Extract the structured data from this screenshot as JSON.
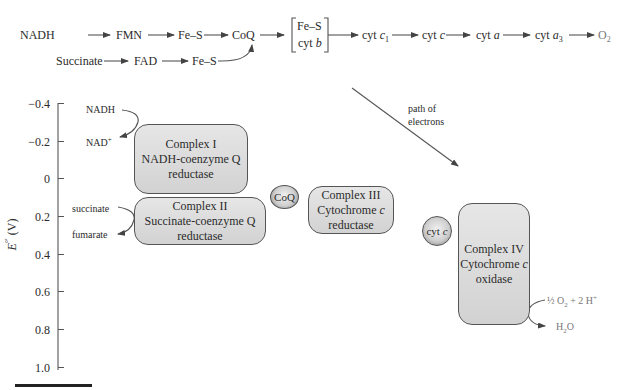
{
  "top_chain": {
    "row1": [
      {
        "label": "NADH"
      },
      {
        "label": "FMN"
      },
      {
        "label": "Fe–S"
      },
      {
        "label": "CoQ"
      },
      {
        "label_line1": "Fe–S",
        "label_line2_prefix": "cyt ",
        "label_line2_italic": "b"
      },
      {
        "label_prefix": "cyt ",
        "label_italic": "c",
        "label_sub": "1"
      },
      {
        "label_prefix": "cyt ",
        "label_italic": "c"
      },
      {
        "label_prefix": "cyt ",
        "label_italic": "a"
      },
      {
        "label_prefix": "cyt ",
        "label_italic": "a",
        "label_sub": "3"
      },
      {
        "label": "O",
        "label_sub": "2"
      }
    ],
    "row2": [
      {
        "label": "Succinate"
      },
      {
        "label": "FAD"
      },
      {
        "label": "Fe–S"
      }
    ]
  },
  "axis": {
    "label_main": "E",
    "label_sup": "°′",
    "label_unit": " (V)",
    "ticks": [
      "−0.4",
      "−0.2",
      "0",
      "0.2",
      "0.4",
      "0.6",
      "0.8",
      "1.0"
    ]
  },
  "annotations": {
    "nadh": "NADH",
    "nad_plus": "NAD",
    "nad_plus_sup": "+",
    "succinate": "succinate",
    "fumarate": "fumarate",
    "path_line1": "path of",
    "path_line2": "electrons",
    "o2_half": "½",
    "o2_rest": " O",
    "o2_sub": "2",
    "o2_tail": " + 2 H",
    "o2_sup": "+",
    "h2o_h": "H",
    "h2o_sub": "2",
    "h2o_o": "O"
  },
  "complexes": [
    {
      "line1": "Complex I",
      "line2": "NADH-coenzyme Q",
      "line3": "reductase"
    },
    {
      "line1": "Complex II",
      "line2": "Succinate-coenzyme Q",
      "line3": "reductase"
    },
    {
      "line1": "Complex III",
      "line2_prefix": "Cytochrome ",
      "line2_italic": "c",
      "line3": "reductase"
    },
    {
      "line1": "Complex IV",
      "line2_prefix": "Cytochrome ",
      "line2_italic": "c",
      "line3": "oxidase"
    }
  ],
  "carriers": {
    "coq": "CoQ",
    "cytc_prefix": "cyt ",
    "cytc_italic": "c"
  },
  "colors": {
    "box_fill": "#dcdcdc",
    "stroke": "#555555",
    "text": "#2b2b2b"
  }
}
